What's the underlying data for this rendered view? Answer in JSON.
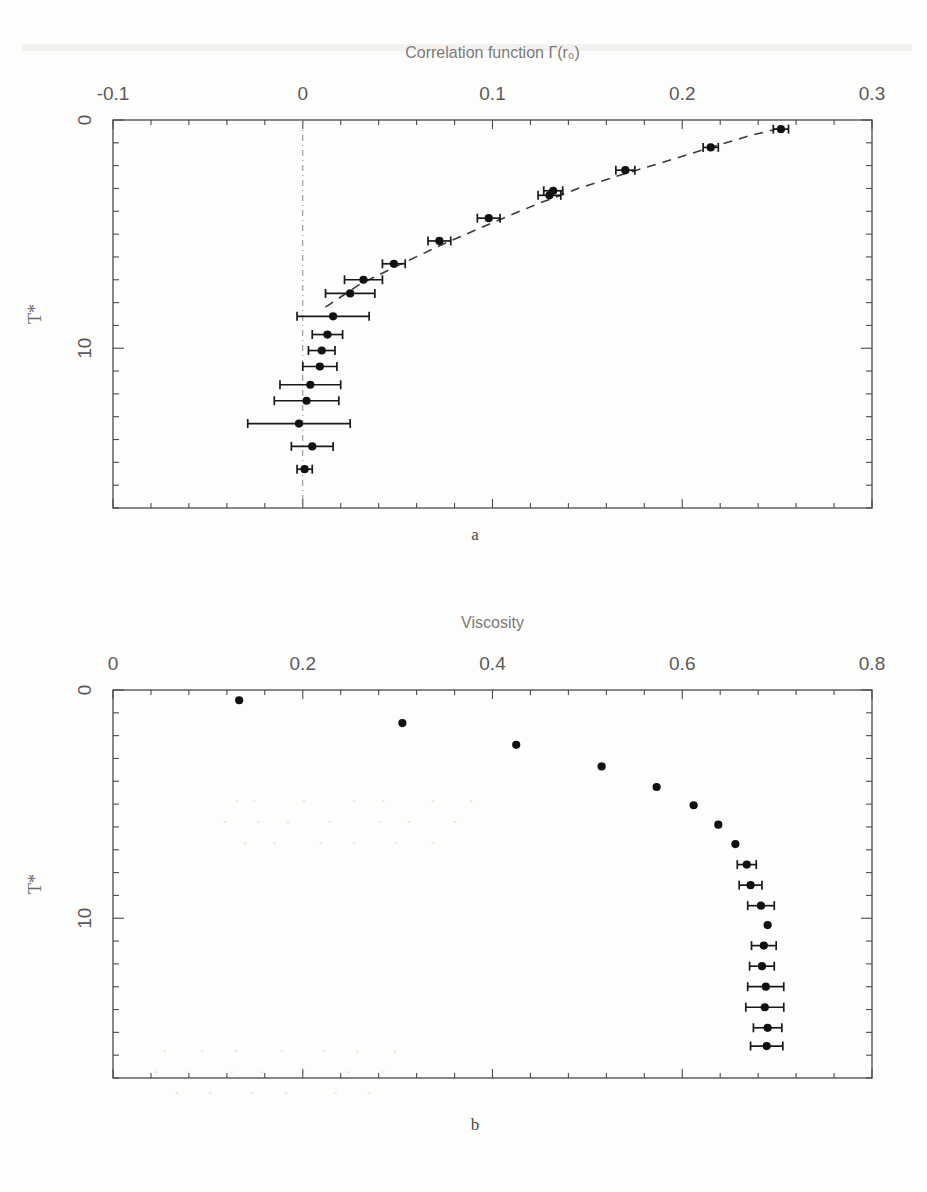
{
  "figure": {
    "panel_a_label": "a",
    "panel_b_label": "b"
  },
  "chart_data": [
    {
      "id": "panel-a",
      "type": "scatter",
      "title": "Correlation function Γ(r₀)",
      "xlabel": "Correlation function Γ(r₀)",
      "ylabel": "T*",
      "xlim": [
        -0.1,
        0.3
      ],
      "ylim": [
        0,
        17
      ],
      "xticks": [
        -0.1,
        0,
        0.1,
        0.2,
        0.3
      ],
      "xtick_labels": [
        "-0.1",
        "0",
        "0.1",
        "0.2",
        "0.3"
      ],
      "yticks": [
        0,
        10
      ],
      "ytick_labels": [
        "0",
        "10"
      ],
      "y_minor_step": 1,
      "grid": false,
      "axis_position": "top",
      "y_inverted": true,
      "zero_reference_line": 0,
      "legend": "none",
      "fit_curve": {
        "style": "dashed",
        "x": [
          0.012,
          0.03,
          0.052,
          0.075,
          0.1,
          0.123,
          0.145,
          0.168,
          0.192,
          0.215,
          0.235,
          0.252
        ],
        "y": [
          8.2,
          7.2,
          6.3,
          5.4,
          4.5,
          3.7,
          3.0,
          2.4,
          1.8,
          1.2,
          0.7,
          0.35
        ]
      },
      "points": [
        {
          "x": 0.252,
          "y": 0.4,
          "xerr": 0.004
        },
        {
          "x": 0.215,
          "y": 1.2,
          "xerr": 0.004
        },
        {
          "x": 0.17,
          "y": 2.2,
          "xerr": 0.005
        },
        {
          "x": 0.132,
          "y": 3.1,
          "xerr": 0.005
        },
        {
          "x": 0.13,
          "y": 3.3,
          "xerr": 0.006
        },
        {
          "x": 0.098,
          "y": 4.3,
          "xerr": 0.006
        },
        {
          "x": 0.072,
          "y": 5.3,
          "xerr": 0.006
        },
        {
          "x": 0.048,
          "y": 6.3,
          "xerr": 0.006
        },
        {
          "x": 0.032,
          "y": 7.0,
          "xerr": 0.01
        },
        {
          "x": 0.025,
          "y": 7.6,
          "xerr": 0.013
        },
        {
          "x": 0.016,
          "y": 8.6,
          "xerr": 0.019
        },
        {
          "x": 0.013,
          "y": 9.4,
          "xerr": 0.008
        },
        {
          "x": 0.01,
          "y": 10.1,
          "xerr": 0.007
        },
        {
          "x": 0.009,
          "y": 10.8,
          "xerr": 0.009
        },
        {
          "x": 0.004,
          "y": 11.6,
          "xerr": 0.016
        },
        {
          "x": 0.002,
          "y": 12.3,
          "xerr": 0.017
        },
        {
          "x": -0.002,
          "y": 13.3,
          "xerr": 0.027
        },
        {
          "x": 0.005,
          "y": 14.3,
          "xerr": 0.011
        },
        {
          "x": 0.001,
          "y": 15.3,
          "xerr": 0.004
        }
      ]
    },
    {
      "id": "panel-b",
      "type": "scatter",
      "title": "Viscosity",
      "xlabel": "Viscosity",
      "ylabel": "T*",
      "xlim": [
        0,
        0.8
      ],
      "ylim": [
        0,
        17
      ],
      "xticks": [
        0,
        0.2,
        0.4,
        0.6,
        0.8
      ],
      "xtick_labels": [
        "0",
        "0.2",
        "0.4",
        "0.6",
        "0.8"
      ],
      "yticks": [
        0,
        10
      ],
      "ytick_labels": [
        "0",
        "10"
      ],
      "y_minor_step": 1,
      "grid": false,
      "axis_position": "top",
      "y_inverted": true,
      "legend": "none",
      "points": [
        {
          "x": 0.133,
          "y": 0.45,
          "xerr": 0.0
        },
        {
          "x": 0.305,
          "y": 1.45,
          "xerr": 0.0
        },
        {
          "x": 0.425,
          "y": 2.4,
          "xerr": 0.0
        },
        {
          "x": 0.515,
          "y": 3.35,
          "xerr": 0.0
        },
        {
          "x": 0.573,
          "y": 4.25,
          "xerr": 0.0
        },
        {
          "x": 0.612,
          "y": 5.05,
          "xerr": 0.0
        },
        {
          "x": 0.638,
          "y": 5.9,
          "xerr": 0.0
        },
        {
          "x": 0.656,
          "y": 6.75,
          "xerr": 0.0
        },
        {
          "x": 0.668,
          "y": 7.65,
          "xerr": 0.01
        },
        {
          "x": 0.672,
          "y": 8.55,
          "xerr": 0.012
        },
        {
          "x": 0.683,
          "y": 9.45,
          "xerr": 0.014
        },
        {
          "x": 0.69,
          "y": 10.3,
          "xerr": 0.0
        },
        {
          "x": 0.686,
          "y": 11.2,
          "xerr": 0.013
        },
        {
          "x": 0.684,
          "y": 12.1,
          "xerr": 0.013
        },
        {
          "x": 0.688,
          "y": 13.0,
          "xerr": 0.019
        },
        {
          "x": 0.687,
          "y": 13.9,
          "xerr": 0.02
        },
        {
          "x": 0.69,
          "y": 14.8,
          "xerr": 0.015
        },
        {
          "x": 0.689,
          "y": 15.6,
          "xerr": 0.017
        }
      ]
    }
  ]
}
